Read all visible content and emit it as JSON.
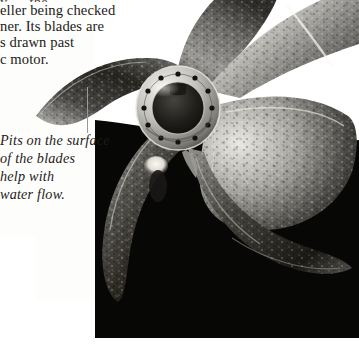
{
  "page": {
    "kind": "scanned-book-page",
    "background_color": "#ffffff",
    "text_color": "#1c1a18",
    "plate_color": "#050505"
  },
  "body_text": {
    "lines": [
      "y … the … ",
      "eller being checked",
      "ner. Its blades are",
      "s drawn past",
      "c motor."
    ],
    "note_line_truncated_left": true
  },
  "caption": {
    "lines": [
      "Pits on the surface",
      "of the blades",
      "help with",
      "water flow."
    ],
    "style": "italic",
    "leader_line_color": "#9a9a9a"
  },
  "photograph": {
    "subject": "ship propeller",
    "blade_count": 5,
    "hub": {
      "bolt_hole_count": 12,
      "center_x": 178,
      "center_y": 108,
      "outer_radius": 42
    },
    "background_color": "#050505",
    "highlight_color": "#f2f0ec",
    "metal_mid_tone": "#8d8b87",
    "metal_dark_tone": "#2a2826"
  }
}
